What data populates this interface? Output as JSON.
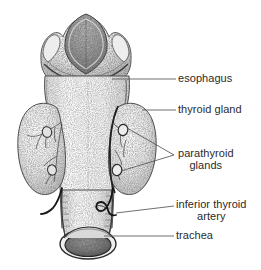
{
  "figure": {
    "background_color": "#ffffff",
    "ink_color": "#2b2b2b",
    "leader_line_color": "#555555",
    "style": "stippled pen-and-ink medical illustration"
  },
  "labels": [
    {
      "id": "esophagus",
      "text": "esophagus",
      "line1": "esophagus",
      "line2": "",
      "x": 178,
      "y": 73,
      "align": "left"
    },
    {
      "id": "thyroid-gland",
      "text": "thyroid gland",
      "line1": "thyroid gland",
      "line2": "",
      "x": 178,
      "y": 104,
      "align": "left"
    },
    {
      "id": "parathyroid-glands",
      "text": "parathyroid glands",
      "line1": "parathyroid",
      "line2": "glands",
      "x": 178,
      "y": 148,
      "align": "left"
    },
    {
      "id": "inferior-thyroid-artery",
      "text": "inferior thyroid artery",
      "line1": "inferior thyroid",
      "line2": "artery",
      "x": 176,
      "y": 199,
      "align": "left"
    },
    {
      "id": "trachea",
      "text": "trachea",
      "line1": "trachea",
      "line2": "",
      "x": 176,
      "y": 230,
      "align": "left"
    }
  ],
  "structures": [
    {
      "id": "epiglottis",
      "name": "epiglottis"
    },
    {
      "id": "larynx-thyroid-cartilage",
      "name": "thyroid cartilage / larynx"
    },
    {
      "id": "esophagus-body",
      "name": "esophagus"
    },
    {
      "id": "thyroid-lobe-left",
      "name": "left thyroid lobe"
    },
    {
      "id": "thyroid-lobe-right",
      "name": "right thyroid lobe"
    },
    {
      "id": "parathyroid-superior-right",
      "name": "superior parathyroid gland"
    },
    {
      "id": "parathyroid-inferior-right",
      "name": "inferior parathyroid gland"
    },
    {
      "id": "parathyroid-superior-left",
      "name": "superior parathyroid gland (left)"
    },
    {
      "id": "parathyroid-inferior-left",
      "name": "inferior parathyroid gland (left)"
    },
    {
      "id": "inferior-thyroid-artery-vessel",
      "name": "inferior thyroid artery"
    },
    {
      "id": "trachea-tube",
      "name": "trachea"
    },
    {
      "id": "trachea-lumen",
      "name": "trachea cut opening"
    }
  ]
}
